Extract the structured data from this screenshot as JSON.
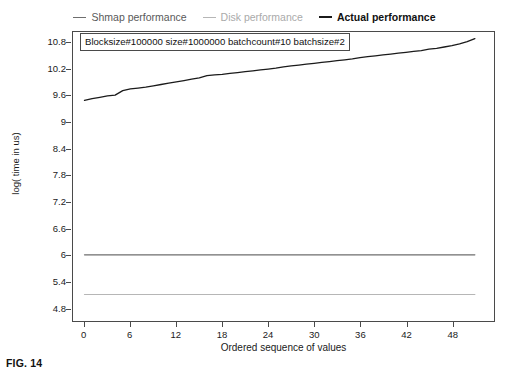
{
  "figure": {
    "caption": "FIG. 14"
  },
  "legend": {
    "position": "top-center",
    "entries": [
      {
        "label": "Shmap performance",
        "color": "#6e6e6e",
        "icon": "line-swatch-icon"
      },
      {
        "label": "Disk performance",
        "color": "#b6b6b6",
        "icon": "line-swatch-icon"
      },
      {
        "label": "Actual performance",
        "color": "#1b1b1b",
        "icon": "line-swatch-icon"
      }
    ]
  },
  "annotation": {
    "text": "Blocksize#100000 size#1000000 batchcount#10 batchsize#2"
  },
  "axes": {
    "ylabel": "log( time in us)",
    "xlabel": "Ordered sequence of values"
  },
  "chart_data": {
    "type": "line",
    "title": "",
    "subtitle": "",
    "xlabel": "Ordered sequence of values",
    "ylabel": "log( time in us)",
    "xlim": [
      -1.5,
      53.5
    ],
    "ylim": [
      4.5,
      11.05
    ],
    "xticks": [
      0,
      6,
      12,
      18,
      24,
      30,
      36,
      42,
      48
    ],
    "yticks": [
      4.8,
      5.4,
      6,
      6.6,
      7.2,
      7.8,
      8.4,
      9,
      9.6,
      10.2,
      10.8
    ],
    "grid": false,
    "legend_position": "top-center",
    "annotations": [
      {
        "text": "Blocksize#100000 size#1000000 batchcount#10 batchsize#2",
        "x": 1,
        "y": 10.95,
        "boxed": true
      }
    ],
    "x": [
      0,
      1,
      2,
      3,
      4,
      5,
      6,
      7,
      8,
      9,
      10,
      11,
      12,
      13,
      14,
      15,
      16,
      17,
      18,
      19,
      20,
      21,
      22,
      23,
      24,
      25,
      26,
      27,
      28,
      29,
      30,
      31,
      32,
      33,
      34,
      35,
      36,
      37,
      38,
      39,
      40,
      41,
      42,
      43,
      44,
      45,
      46,
      47,
      48,
      49,
      50,
      51
    ],
    "series": [
      {
        "name": "Actual performance",
        "color": "#1b1b1b",
        "linewidth": 1.3,
        "values": [
          9.5,
          9.54,
          9.57,
          9.6,
          9.62,
          9.72,
          9.76,
          9.78,
          9.8,
          9.83,
          9.86,
          9.89,
          9.92,
          9.95,
          9.98,
          10.01,
          10.06,
          10.08,
          10.09,
          10.11,
          10.13,
          10.15,
          10.17,
          10.19,
          10.21,
          10.23,
          10.26,
          10.28,
          10.3,
          10.32,
          10.34,
          10.36,
          10.38,
          10.4,
          10.42,
          10.44,
          10.47,
          10.49,
          10.51,
          10.53,
          10.55,
          10.57,
          10.59,
          10.61,
          10.63,
          10.66,
          10.68,
          10.71,
          10.74,
          10.78,
          10.83,
          10.9
        ]
      },
      {
        "name": "Shmap performance",
        "color": "#6e6e6e",
        "linewidth": 1.2,
        "constant": 6.0,
        "values": [
          6.0,
          6.0,
          6.0,
          6.0,
          6.0,
          6.0,
          6.0,
          6.0,
          6.0,
          6.0,
          6.0,
          6.0,
          6.0,
          6.0,
          6.0,
          6.0,
          6.0,
          6.0,
          6.0,
          6.0,
          6.0,
          6.0,
          6.0,
          6.0,
          6.0,
          6.0,
          6.0,
          6.0,
          6.0,
          6.0,
          6.0,
          6.0,
          6.0,
          6.0,
          6.0,
          6.0,
          6.0,
          6.0,
          6.0,
          6.0,
          6.0,
          6.0,
          6.0,
          6.0,
          6.0,
          6.0,
          6.0,
          6.0,
          6.0,
          6.0,
          6.0,
          6.0
        ]
      },
      {
        "name": "Disk performance",
        "color": "#b6b6b6",
        "linewidth": 1.2,
        "constant": 5.1,
        "values": [
          5.1,
          5.1,
          5.1,
          5.1,
          5.1,
          5.1,
          5.1,
          5.1,
          5.1,
          5.1,
          5.1,
          5.1,
          5.1,
          5.1,
          5.1,
          5.1,
          5.1,
          5.1,
          5.1,
          5.1,
          5.1,
          5.1,
          5.1,
          5.1,
          5.1,
          5.1,
          5.1,
          5.1,
          5.1,
          5.1,
          5.1,
          5.1,
          5.1,
          5.1,
          5.1,
          5.1,
          5.1,
          5.1,
          5.1,
          5.1,
          5.1,
          5.1,
          5.1,
          5.1,
          5.1,
          5.1,
          5.1,
          5.1,
          5.1,
          5.1,
          5.1,
          5.1
        ]
      }
    ]
  }
}
